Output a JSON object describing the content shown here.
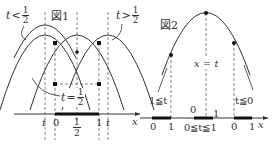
{
  "figure1": {
    "title": "図1",
    "label_left": {
      "var": "t",
      "op": "<",
      "num": "1",
      "den": "2"
    },
    "label_right": {
      "var": "t",
      "op": ">",
      "num": "1",
      "den": "2"
    },
    "label_mid": {
      "var": "t",
      "op": "=",
      "num": "1",
      "den": "2"
    },
    "axis": {
      "x_label": "x",
      "ticks": [
        "t",
        "0",
        "1",
        "t"
      ],
      "half_num": "1",
      "half_den": "2"
    }
  },
  "figure2": {
    "title": "図2",
    "axis_label": "x = t",
    "x_label": "x",
    "cases": [
      {
        "label": "1≦t",
        "ticks": [
          "0",
          "1"
        ]
      },
      {
        "label": "0≦t≦1",
        "ticks": [
          "0",
          "1"
        ]
      },
      {
        "label": "t≦0",
        "ticks": [
          "0",
          "1"
        ]
      }
    ]
  },
  "colors": {
    "curve": "#333333",
    "dashed": "#555555",
    "bold_segment": "#222222"
  }
}
